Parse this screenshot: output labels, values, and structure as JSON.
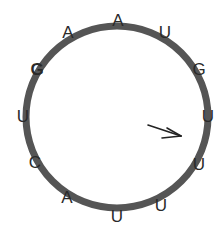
{
  "diagram": {
    "type": "circular RNA sequence",
    "ring_color": "#555555",
    "letter_color": "#2a2a2a",
    "nucleotides": [
      {
        "base": "A",
        "bold": false
      },
      {
        "base": "U",
        "bold": false
      },
      {
        "base": "G",
        "bold": false
      },
      {
        "base": "U",
        "bold": false
      },
      {
        "base": "U",
        "bold": false
      },
      {
        "base": "U",
        "bold": false
      },
      {
        "base": "U",
        "bold": false
      },
      {
        "base": "A",
        "bold": false
      },
      {
        "base": "C",
        "bold": false
      },
      {
        "base": "U",
        "bold": false
      },
      {
        "base": "G",
        "bold": true
      },
      {
        "base": "A",
        "bold": false
      }
    ],
    "arrow": {
      "label": "start-marker"
    }
  }
}
